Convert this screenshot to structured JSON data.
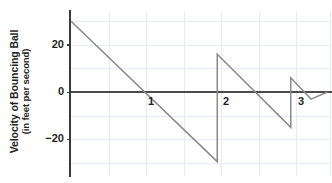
{
  "chart_data": {
    "type": "line",
    "title": "",
    "ylabel_line1": "Velocity of Bouncing Ball",
    "ylabel_line2": "(in feet per second)",
    "xlabel": "",
    "xlim": [
      0,
      3.45
    ],
    "ylim": [
      -33,
      32
    ],
    "grid": true,
    "legend_position": "none",
    "y_ticks": [
      {
        "value": 20,
        "label": "20"
      },
      {
        "value": 0,
        "label": "0"
      },
      {
        "value": -20,
        "label": "−20"
      }
    ],
    "x_ticks": [
      {
        "value": 1,
        "label": "1"
      },
      {
        "value": 2,
        "label": "2"
      },
      {
        "value": 3,
        "label": "3"
      }
    ],
    "x_gridlines": [
      0.5,
      1.0,
      1.5,
      2.0,
      2.5,
      3.0,
      3.45
    ],
    "y_gridlines": [
      30,
      20,
      10,
      -10,
      -20,
      -30
    ],
    "series": [
      {
        "name": "Velocity of bouncing ball",
        "color": "#8a8a8c",
        "x": [
          0.0,
          1.95,
          1.95,
          2.93,
          2.93,
          3.2,
          3.42
        ],
        "y": [
          30.0,
          -29.5,
          16.0,
          -15.0,
          6.0,
          -3.0,
          0.0
        ],
        "annotations": [
          "free fall from rest: velocity decreases linearly from +30 to -29.5 ft/s",
          "first bounce at t≈1.95 s: instantaneous reversal to +16 ft/s",
          "second bounce at t≈2.93 s: instantaneous reversal to +6 ft/s",
          "third bounce at t≈3.20 s: reversal to near 0 ft/s"
        ]
      }
    ],
    "axis_colors": {
      "axis": "#4a4a4c",
      "grid": "#e7ecf2",
      "series": "#8a8a8c",
      "text": "#231f20"
    }
  }
}
